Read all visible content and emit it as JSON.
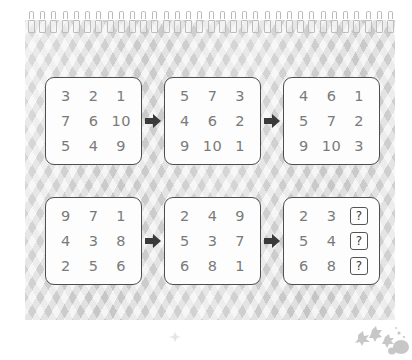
{
  "puzzle": {
    "title": "Number grid sequence puzzle",
    "page_style": "spiral-bound notebook page",
    "rows": [
      {
        "name": "top-sequence",
        "cards": [
          {
            "name": "card-1",
            "grid": [
              [
                "3",
                "2",
                "1"
              ],
              [
                "7",
                "6",
                "10"
              ],
              [
                "5",
                "4",
                "9"
              ]
            ]
          },
          {
            "name": "card-2",
            "grid": [
              [
                "5",
                "7",
                "3"
              ],
              [
                "4",
                "6",
                "2"
              ],
              [
                "9",
                "10",
                "1"
              ]
            ]
          },
          {
            "name": "card-3",
            "grid": [
              [
                "4",
                "6",
                "1"
              ],
              [
                "5",
                "7",
                "2"
              ],
              [
                "9",
                "10",
                "3"
              ]
            ]
          }
        ]
      },
      {
        "name": "bottom-sequence",
        "cards": [
          {
            "name": "card-4",
            "grid": [
              [
                "9",
                "7",
                "1"
              ],
              [
                "4",
                "3",
                "8"
              ],
              [
                "2",
                "5",
                "6"
              ]
            ]
          },
          {
            "name": "card-5",
            "grid": [
              [
                "2",
                "4",
                "9"
              ],
              [
                "5",
                "3",
                "7"
              ],
              [
                "6",
                "8",
                "1"
              ]
            ]
          },
          {
            "name": "card-6",
            "grid": [
              [
                "2",
                "3",
                "?"
              ],
              [
                "5",
                "4",
                "?"
              ],
              [
                "6",
                "8",
                "?"
              ]
            ],
            "unknown_marker": "?"
          }
        ]
      }
    ],
    "arrow_symbol": "➡",
    "colors": {
      "page_background": "#d6d6d6",
      "card_background": "#fdfdfd",
      "card_border": "#4f4f4f",
      "digit_text": "#7a7a7a",
      "arrow": "#3a3a3a",
      "question_box_border": "#555555",
      "question_mark_text": "#3b3b3b",
      "spiral_wire": "#bdbdbd"
    },
    "spiral_wire_count": 33
  }
}
